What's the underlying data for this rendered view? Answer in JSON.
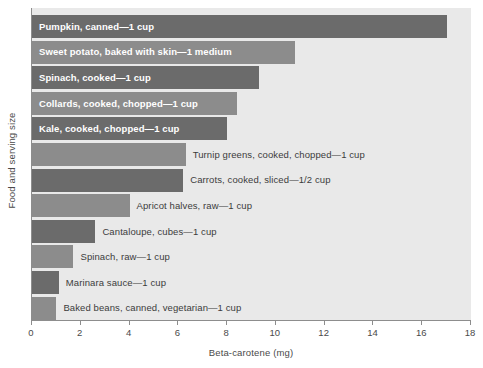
{
  "chart_data": {
    "type": "bar",
    "orientation": "horizontal",
    "title": "",
    "xlabel": "Beta-carotene (mg)",
    "ylabel": "Food and serving size",
    "xlim": [
      0,
      18
    ],
    "xticks": [
      0,
      2,
      4,
      6,
      8,
      10,
      12,
      14,
      16,
      18
    ],
    "xtick_labels": [
      "0",
      "2",
      "4",
      "6",
      "8",
      "10",
      "12",
      "14",
      "16",
      "18"
    ],
    "grid": false,
    "legend": null,
    "categories": [
      "Pumpkin, canned—1 cup",
      "Sweet potato, baked with skin—1 medium",
      "Spinach, cooked—1 cup",
      "Collards, cooked, chopped—1 cup",
      "Kale, cooked, chopped—1 cup",
      "Turnip greens, cooked, chopped—1 cup",
      "Carrots, cooked, sliced—1/2 cup",
      "Apricot halves, raw—1 cup",
      "Cantaloupe, cubes—1 cup",
      "Spinach, raw—1 cup",
      "Marinara sauce—1 cup",
      "Baked beans, canned, vegetarian—1 cup"
    ],
    "values": [
      17.0,
      10.8,
      9.3,
      8.4,
      8.0,
      6.3,
      6.2,
      4.0,
      2.6,
      1.7,
      1.1,
      1.0
    ],
    "bar_colors": [
      "#6b6b6b",
      "#8c8c8c",
      "#6b6b6b",
      "#8c8c8c",
      "#6b6b6b",
      "#8c8c8c",
      "#6b6b6b",
      "#8c8c8c",
      "#6b6b6b",
      "#8c8c8c",
      "#6b6b6b",
      "#8c8c8c"
    ],
    "label_placement": [
      "inside",
      "inside",
      "inside",
      "inside",
      "inside",
      "outside",
      "outside",
      "outside",
      "outside",
      "outside",
      "outside",
      "outside"
    ],
    "plot_background": "#e9e9e9",
    "axis_color": "#8d8d8d"
  }
}
